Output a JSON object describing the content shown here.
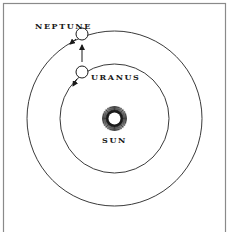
{
  "diagram": {
    "title": "",
    "colors": {
      "background": "#ffffff",
      "frame": "#8a8a8a",
      "orbit": "#3a3a3a",
      "ink": "#1a1a1a"
    },
    "frame": {
      "x": 3.5,
      "y": 3.5,
      "width": 222,
      "height": 240
    },
    "sun": {
      "label": "SUN",
      "cx": 114.5,
      "cy": 118.5,
      "ray_outer_radius": 12.5,
      "ray_inner_radius": 7,
      "core_radius": 6,
      "ray_count": 72,
      "label_x": 114.5,
      "label_y": 143
    },
    "orbits": [
      {
        "name": "uranus-orbit",
        "cx": 114.5,
        "cy": 118.5,
        "r": 54.5
      },
      {
        "name": "neptune-orbit",
        "cx": 114.5,
        "cy": 118.5,
        "r": 87.5
      }
    ],
    "planets": [
      {
        "name": "NEPTUNE",
        "cx": 82,
        "cy": 34,
        "r": 6,
        "label_x": 35,
        "label_y": 29,
        "label_anchor": "start"
      },
      {
        "name": "URANUS",
        "cx": 82,
        "cy": 72,
        "r": 6,
        "label_x": 91,
        "label_y": 80,
        "label_anchor": "start"
      }
    ],
    "arrows": [
      {
        "name": "uranus-pulled-toward-neptune",
        "x1": 82,
        "y1": 62,
        "x2": 82,
        "y2": 45
      },
      {
        "name": "neptune-orbit-direction",
        "x1": 76,
        "y1": 39,
        "x2": 70,
        "y2": 44
      },
      {
        "name": "uranus-orbit-direction",
        "x1": 77,
        "y1": 79,
        "x2": 73,
        "y2": 86
      }
    ]
  }
}
